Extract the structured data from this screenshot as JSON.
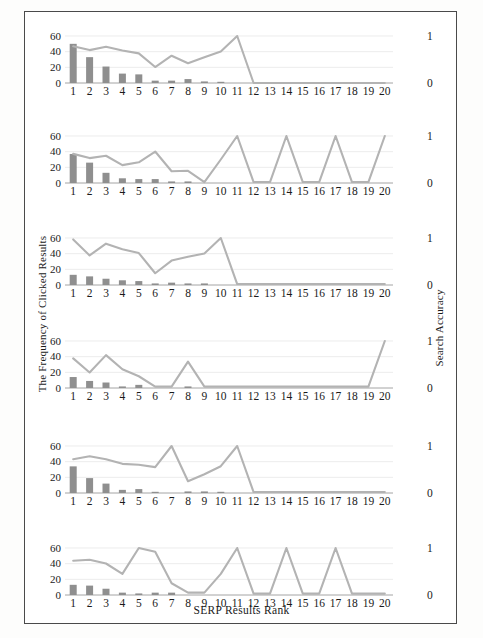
{
  "figure": {
    "xlabel": "SERP Results Rank",
    "ylabel_left": "The Frequency of Clicked Results",
    "ylabel_right": "Search Accuracy",
    "left_ticks": [
      "0",
      "20",
      "40",
      "60"
    ],
    "right_ticks": [
      "0",
      "1"
    ],
    "x_ticks": [
      "1",
      "2",
      "3",
      "4",
      "5",
      "6",
      "7",
      "8",
      "9",
      "10",
      "11",
      "12",
      "13",
      "14",
      "15",
      "16",
      "17",
      "18",
      "19",
      "20"
    ],
    "bar_color": "#8f8f8f",
    "line_color": "#b3b3b3",
    "grid_color": "#e4e4e4",
    "border_color": "#4a4a4a"
  },
  "chart_data": [
    {
      "type": "bar",
      "panel": 1,
      "title": "",
      "xlabel": "SERP Results Rank",
      "ylabel": "The Frequency of Clicked Results",
      "ylim": [
        0,
        60
      ],
      "y2label": "Search Accuracy",
      "y2lim": [
        0,
        1
      ],
      "grid": true,
      "categories": [
        "1",
        "2",
        "3",
        "4",
        "5",
        "6",
        "7",
        "8",
        "9",
        "10",
        "11",
        "12",
        "13",
        "14",
        "15",
        "16",
        "17",
        "18",
        "19",
        "20"
      ],
      "series": [
        {
          "name": "The Frequency of Clicked Results",
          "type": "bar",
          "values": [
            50,
            33,
            21,
            12,
            11,
            3,
            3,
            5,
            2,
            1,
            0,
            0,
            0,
            0,
            0,
            0,
            0,
            0,
            0,
            0
          ]
        },
        {
          "name": "Search Accuracy",
          "type": "line",
          "axis": "right",
          "values": [
            0.78,
            0.7,
            0.77,
            0.69,
            0.63,
            0.34,
            0.58,
            0.42,
            0.55,
            0.67,
            1.0,
            0,
            0,
            0,
            0,
            0,
            0,
            0,
            0,
            0
          ]
        }
      ]
    },
    {
      "type": "bar",
      "panel": 2,
      "ylim": [
        0,
        60
      ],
      "y2lim": [
        0,
        1
      ],
      "grid": true,
      "categories": [
        "1",
        "2",
        "3",
        "4",
        "5",
        "6",
        "7",
        "8",
        "9",
        "10",
        "11",
        "12",
        "13",
        "14",
        "15",
        "16",
        "17",
        "18",
        "19",
        "20"
      ],
      "series": [
        {
          "name": "The Frequency of Clicked Results",
          "type": "bar",
          "values": [
            37,
            26,
            13,
            6,
            5,
            5,
            2,
            2,
            0,
            0,
            0,
            0,
            0,
            0,
            0,
            0,
            0,
            0,
            0,
            0
          ]
        },
        {
          "name": "Search Accuracy",
          "type": "line",
          "axis": "right",
          "values": [
            0.62,
            0.53,
            0.58,
            0.38,
            0.44,
            0.67,
            0.25,
            0.26,
            0.02,
            0.5,
            1.0,
            0.02,
            0.02,
            1.0,
            0.02,
            0.02,
            1.0,
            0.02,
            0.02,
            1.0
          ]
        }
      ]
    },
    {
      "type": "bar",
      "panel": 3,
      "ylim": [
        0,
        60
      ],
      "y2lim": [
        0,
        1
      ],
      "grid": true,
      "categories": [
        "1",
        "2",
        "3",
        "4",
        "5",
        "6",
        "7",
        "8",
        "9",
        "10",
        "11",
        "12",
        "13",
        "14",
        "15",
        "16",
        "17",
        "18",
        "19",
        "20"
      ],
      "series": [
        {
          "name": "The Frequency of Clicked Results",
          "type": "bar",
          "values": [
            13,
            11,
            8,
            6,
            5,
            2,
            3,
            2,
            2,
            0,
            0,
            0,
            0,
            0,
            0,
            0,
            0,
            0,
            0,
            0
          ]
        },
        {
          "name": "Search Accuracy",
          "type": "line",
          "axis": "right",
          "values": [
            0.97,
            0.63,
            0.88,
            0.76,
            0.68,
            0.25,
            0.52,
            0.6,
            0.67,
            1.0,
            0.02,
            0.02,
            0.02,
            0.02,
            0.02,
            0.02,
            0.02,
            0.02,
            0.02,
            0.02
          ]
        }
      ]
    },
    {
      "type": "bar",
      "panel": 4,
      "ylim": [
        0,
        60
      ],
      "y2lim": [
        0,
        1
      ],
      "grid": true,
      "categories": [
        "1",
        "2",
        "3",
        "4",
        "5",
        "6",
        "7",
        "8",
        "9",
        "10",
        "11",
        "12",
        "13",
        "14",
        "15",
        "16",
        "17",
        "18",
        "19",
        "20"
      ],
      "series": [
        {
          "name": "The Frequency of Clicked Results",
          "type": "bar",
          "values": [
            14,
            9,
            7,
            2,
            4,
            0,
            0,
            2,
            0,
            0,
            0,
            0,
            0,
            0,
            0,
            0,
            0,
            0,
            0,
            0
          ]
        },
        {
          "name": "Search Accuracy",
          "type": "line",
          "axis": "right",
          "values": [
            0.63,
            0.33,
            0.7,
            0.4,
            0.25,
            0.03,
            0.03,
            0.56,
            0.03,
            0.03,
            0.03,
            0.03,
            0.03,
            0.03,
            0.03,
            0.03,
            0.03,
            0.03,
            0.03,
            1.0
          ]
        }
      ]
    },
    {
      "type": "bar",
      "panel": 5,
      "ylim": [
        0,
        60
      ],
      "y2lim": [
        0,
        1
      ],
      "grid": true,
      "categories": [
        "1",
        "2",
        "3",
        "4",
        "5",
        "6",
        "7",
        "8",
        "9",
        "10",
        "11",
        "12",
        "13",
        "14",
        "15",
        "16",
        "17",
        "18",
        "19",
        "20"
      ],
      "series": [
        {
          "name": "The Frequency of Clicked Results",
          "type": "bar",
          "values": [
            34,
            19,
            12,
            4,
            5,
            1,
            0,
            2,
            2,
            1,
            0,
            0,
            0,
            0,
            0,
            0,
            0,
            0,
            0,
            0
          ]
        },
        {
          "name": "Search Accuracy",
          "type": "line",
          "axis": "right",
          "values": [
            0.72,
            0.78,
            0.72,
            0.62,
            0.6,
            0.55,
            1.0,
            0.25,
            0.4,
            0.57,
            1.0,
            0.02,
            0.02,
            0.02,
            0.02,
            0.02,
            0.02,
            0.02,
            0.02,
            0.02
          ]
        }
      ]
    },
    {
      "type": "bar",
      "panel": 6,
      "ylim": [
        0,
        60
      ],
      "y2lim": [
        0,
        1
      ],
      "grid": true,
      "categories": [
        "1",
        "2",
        "3",
        "4",
        "5",
        "6",
        "7",
        "8",
        "9",
        "10",
        "11",
        "12",
        "13",
        "14",
        "15",
        "16",
        "17",
        "18",
        "19",
        "20"
      ],
      "series": [
        {
          "name": "The Frequency of Clicked Results",
          "type": "bar",
          "values": [
            13,
            12,
            8,
            3,
            2,
            3,
            3,
            0,
            0,
            0,
            0,
            0,
            0,
            0,
            0,
            0,
            0,
            0,
            0,
            0
          ]
        },
        {
          "name": "Search Accuracy",
          "type": "line",
          "axis": "right",
          "values": [
            0.73,
            0.75,
            0.67,
            0.45,
            1.0,
            0.92,
            0.25,
            0.05,
            0.05,
            0.45,
            1.0,
            0.03,
            0.03,
            1.0,
            0.03,
            0.03,
            1.0,
            0.03,
            0.03,
            0.03
          ]
        }
      ]
    }
  ]
}
